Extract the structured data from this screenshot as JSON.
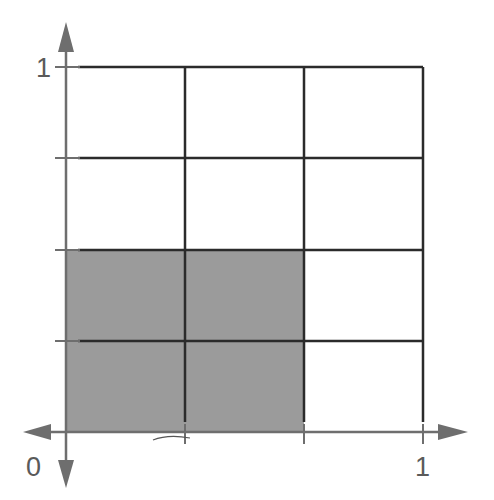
{
  "diagram": {
    "labels": {
      "y_axis_top": "1",
      "origin": "0",
      "x_axis_right": "1"
    },
    "grid": {
      "columns": 3,
      "rows": 4,
      "x_lines_px": [
        66,
        185,
        304,
        423
      ],
      "y_lines_px": [
        67,
        158,
        250,
        341,
        432
      ]
    },
    "shaded_region": {
      "from_col": 0,
      "to_col": 2,
      "from_row": 2,
      "to_row": 4,
      "shaded_parts": 6,
      "total_parts": 12
    },
    "colors": {
      "grid_line": "#2b2b2b",
      "axis": "#6e6e6e",
      "shade": "#9b9b9b",
      "label": "#5a5a5a",
      "background": "#ffffff"
    }
  }
}
